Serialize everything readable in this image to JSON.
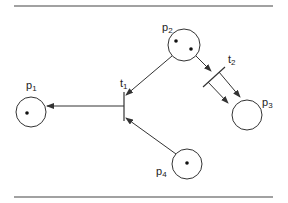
{
  "diagram": {
    "type": "petri-net",
    "colors": {
      "stroke": "#333333",
      "background": "#ffffff"
    },
    "places": [
      {
        "id": "p1",
        "label": "p",
        "sub": "1",
        "tokens": 1
      },
      {
        "id": "p2",
        "label": "p",
        "sub": "2",
        "tokens": 2
      },
      {
        "id": "p3",
        "label": "p",
        "sub": "3",
        "tokens": 0
      },
      {
        "id": "p4",
        "label": "p",
        "sub": "4",
        "tokens": 1
      }
    ],
    "transitions": [
      {
        "id": "t1",
        "label": "t",
        "sub": "1"
      },
      {
        "id": "t2",
        "label": "t",
        "sub": "2"
      }
    ],
    "arcs": [
      {
        "from": "p2",
        "to": "t1"
      },
      {
        "from": "p4",
        "to": "t1"
      },
      {
        "from": "t1",
        "to": "p1"
      },
      {
        "from": "p2",
        "to": "t2"
      },
      {
        "from": "t2",
        "to": "p3"
      }
    ]
  }
}
